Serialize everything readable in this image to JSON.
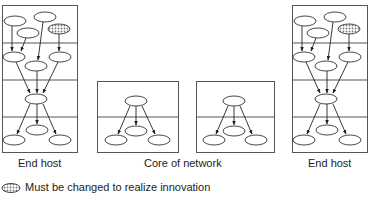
{
  "labels": {
    "left_host": "End host",
    "core": "Core of network",
    "right_host": "End host"
  },
  "legend": {
    "icon": "dotted-ellipse",
    "text": "Must be changed to realize innovation"
  },
  "diagram": {
    "left_host_layers": 4,
    "core_layers": 2,
    "right_host_layers": 4,
    "colors": {
      "stroke": "#555555",
      "pattern": "#888888"
    }
  }
}
